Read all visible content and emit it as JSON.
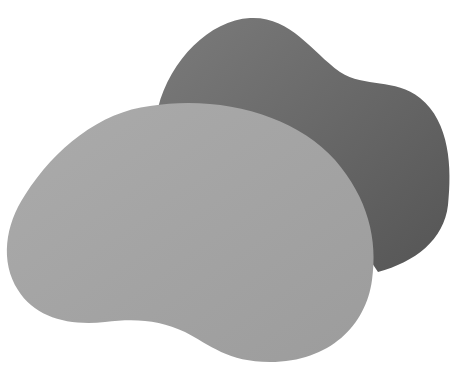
{
  "canvas": {
    "width": 457,
    "height": 372,
    "background": "#ffffff"
  },
  "shapes": [
    {
      "name": "back-blob",
      "fill": "#6b6b6b",
      "fill_light": "#7a7a7a"
    },
    {
      "name": "front-blob",
      "fill": "#a3a3a3",
      "fill_light": "#acacac"
    }
  ]
}
